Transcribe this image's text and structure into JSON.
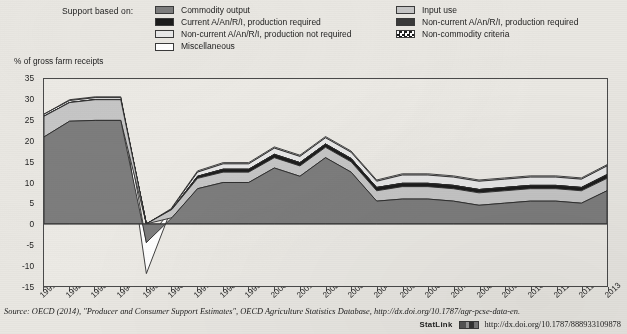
{
  "legend": {
    "title": "Support based on:",
    "left_column": [
      {
        "label": "Commodity output",
        "swatch": "#7d7d7d",
        "pattern": "solid"
      },
      {
        "label": "Current A/An/R/I, production required",
        "swatch": "#1c1c1c",
        "pattern": "solid"
      },
      {
        "label": "Non-current A/An/R/I, production not required",
        "swatch": "#e8e8e8",
        "pattern": "solid"
      },
      {
        "label": "Miscellaneous",
        "swatch": "#ffffff",
        "pattern": "solid"
      }
    ],
    "right_column": [
      {
        "label": "Input use",
        "swatch": "#c6c6c6",
        "pattern": "solid"
      },
      {
        "label": "Non-current A/An/R/I, production required",
        "swatch": "#3a3a3a",
        "pattern": "solid"
      },
      {
        "label": "Non-commodity criteria",
        "swatch": "#ffffff",
        "pattern": "checker"
      }
    ]
  },
  "chart_data": {
    "type": "area",
    "stacked": true,
    "title": "",
    "xlabel": "",
    "ylabel": "% of gross farm receipts",
    "ylim": [
      -15,
      35
    ],
    "yticks": [
      35,
      30,
      25,
      20,
      15,
      10,
      5,
      0,
      -5,
      -10,
      -15
    ],
    "grid": false,
    "legend_position": "top",
    "x": [
      1991,
      1992,
      1993,
      1994,
      1995,
      1996,
      1997,
      1998,
      1999,
      2000,
      2001,
      2002,
      2003,
      2004,
      2005,
      2006,
      2007,
      2008,
      2009,
      2010,
      2011,
      2012,
      2013
    ],
    "categories": [
      "1991",
      "1992",
      "1993",
      "1994",
      "1995",
      "1996",
      "1997",
      "1998",
      "1999",
      "2000",
      "2001",
      "2002",
      "2003",
      "2004",
      "2005",
      "2006",
      "2007",
      "2008",
      "2009",
      "2010",
      "2011",
      "2012",
      "2013"
    ],
    "series": [
      {
        "name": "Commodity output",
        "color": "#7d7d7d",
        "values": [
          21.0,
          24.8,
          25.0,
          25.0,
          -4.5,
          1.5,
          8.5,
          10.0,
          10.0,
          13.5,
          11.5,
          16.0,
          12.5,
          5.5,
          6.0,
          6.0,
          5.5,
          4.5,
          5.0,
          5.5,
          5.5,
          5.0,
          8.0
        ]
      },
      {
        "name": "Input use",
        "color": "#c6c6c6",
        "values": [
          5.0,
          4.5,
          5.0,
          5.0,
          0.0,
          2.0,
          2.5,
          2.5,
          2.5,
          2.5,
          2.5,
          2.5,
          2.5,
          2.5,
          3.0,
          3.0,
          3.0,
          3.0,
          3.0,
          3.0,
          3.0,
          3.0,
          3.0
        ]
      },
      {
        "name": "Current A/An/R/I, production required",
        "color": "#1c1c1c",
        "values": [
          0.0,
          0.0,
          0.0,
          0.0,
          0.0,
          0.0,
          0.5,
          0.7,
          0.7,
          0.8,
          0.8,
          0.8,
          0.8,
          0.8,
          0.8,
          0.8,
          0.8,
          0.8,
          0.8,
          0.8,
          0.8,
          0.8,
          0.9
        ]
      },
      {
        "name": "Non-current A/An/R/I, production required",
        "color": "#3a3a3a",
        "values": [
          0.0,
          0.0,
          0.0,
          0.0,
          0.0,
          0.0,
          0.0,
          0.0,
          0.0,
          0.0,
          0.0,
          0.0,
          0.0,
          0.0,
          0.0,
          0.0,
          0.0,
          0.0,
          0.0,
          0.0,
          0.0,
          0.0,
          0.0
        ]
      },
      {
        "name": "Non-current A/An/R/I, production not required",
        "color": "#e8e8e8",
        "values": [
          0.5,
          0.5,
          0.5,
          0.5,
          0.0,
          0.3,
          1.0,
          1.3,
          1.3,
          1.5,
          1.5,
          1.5,
          1.5,
          1.5,
          2.0,
          2.0,
          2.0,
          2.0,
          2.0,
          2.0,
          2.0,
          2.0,
          2.1
        ]
      },
      {
        "name": "Miscellaneous",
        "color": "#ffffff",
        "values": [
          0.0,
          0.2,
          0.2,
          0.2,
          -7.5,
          0.2,
          0.3,
          0.3,
          0.3,
          0.3,
          0.3,
          0.3,
          0.3,
          0.3,
          0.3,
          0.3,
          0.3,
          0.3,
          0.3,
          0.3,
          0.3,
          0.3,
          0.3
        ]
      }
    ],
    "totals": [
      26.5,
      30.0,
      30.7,
      30.7,
      -12.0,
      4.0,
      12.8,
      14.8,
      14.8,
      18.6,
      16.6,
      21.1,
      17.6,
      10.6,
      12.1,
      12.1,
      11.6,
      10.6,
      11.1,
      11.6,
      11.6,
      11.1,
      14.3
    ]
  },
  "source": {
    "prefix": "Source:",
    "text": "OECD (2014), \"Producer and Consumer Support Estimates\", OECD Agriculture Statistics Database, http://dx.doi.org/10.1787/agr-pcse-data-en."
  },
  "statlink": {
    "label": "StatLink",
    "url": "http://dx.doi.org/10.1787/888933109878",
    "icon": "statlink-barcode-icon"
  }
}
